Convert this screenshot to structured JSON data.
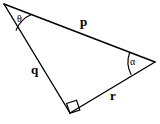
{
  "figure": {
    "type": "geometry-diagram",
    "background_color": "#ffffff",
    "stroke_color": "#000000",
    "vertices": {
      "theta_vertex": {
        "name": "theta-vertex",
        "x": 4,
        "y": 4
      },
      "alpha_vertex": {
        "name": "alpha-vertex",
        "x": 155,
        "y": 62
      },
      "right_angle_vertex": {
        "name": "right-angle-vertex",
        "x": 70,
        "y": 113
      }
    },
    "sides": [
      {
        "id": "p",
        "label": "p",
        "from": "theta_vertex",
        "to": "alpha_vertex",
        "label_x": 80,
        "label_y": 15
      },
      {
        "id": "q",
        "label": "q",
        "from": "theta_vertex",
        "to": "right_angle_vertex",
        "label_x": 31,
        "label_y": 63
      },
      {
        "id": "r",
        "label": "r",
        "from": "right_angle_vertex",
        "to": "alpha_vertex",
        "label_x": 110,
        "label_y": 89
      }
    ],
    "angles": [
      {
        "id": "theta",
        "label": "θ",
        "at": "theta_vertex",
        "marker": "arc",
        "label_x": 17,
        "label_y": 14
      },
      {
        "id": "alpha",
        "label": "α",
        "at": "alpha_vertex",
        "marker": "arc",
        "label_x": 130,
        "label_y": 57
      },
      {
        "id": "right",
        "label": "",
        "at": "right_angle_vertex",
        "marker": "square",
        "measure_degrees": 90
      }
    ]
  }
}
